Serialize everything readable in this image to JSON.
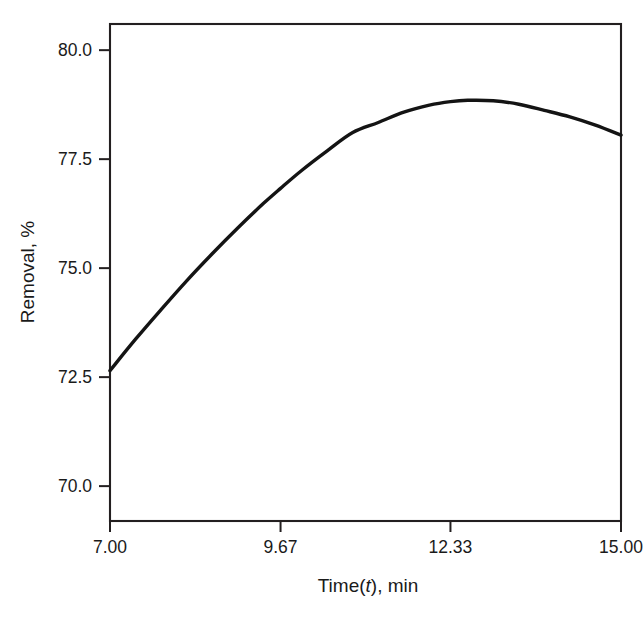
{
  "chart_data": {
    "type": "line",
    "title": "",
    "subtitle": "",
    "xlabel_parts": {
      "pre": "Time(",
      "var": "t",
      "post": "), min"
    },
    "xlabel": "Time(t), min",
    "ylabel": "Removal, %",
    "xlim": [
      7.0,
      15.0
    ],
    "ylim": [
      69.2,
      80.6
    ],
    "xticks": [
      7.0,
      9.67,
      12.33,
      15.0
    ],
    "xtick_labels": [
      "7.00",
      "9.67",
      "12.33",
      "15.00"
    ],
    "yticks": [
      70.0,
      72.5,
      75.0,
      77.5,
      80.0
    ],
    "ytick_labels": [
      "70.0",
      "72.5",
      "75.0",
      "77.5",
      "80.0"
    ],
    "grid": false,
    "legend": "none",
    "series": [
      {
        "name": "Removal",
        "color": "#141414",
        "x": [
          7.0,
          7.4,
          7.8,
          8.2,
          8.6,
          9.0,
          9.4,
          9.67,
          10.0,
          10.4,
          10.8,
          11.2,
          11.6,
          12.0,
          12.33,
          12.6,
          13.0,
          13.4,
          13.8,
          14.2,
          14.6,
          15.0
        ],
        "y": [
          72.65,
          73.37,
          74.05,
          74.71,
          75.33,
          75.92,
          76.48,
          76.83,
          77.24,
          77.69,
          78.11,
          78.34,
          78.58,
          78.74,
          78.82,
          78.85,
          78.84,
          78.76,
          78.62,
          78.47,
          78.28,
          78.05
        ]
      }
    ],
    "fit": {
      "form": "quadratic",
      "equation": "y = 72.65 + 1.86 (t - 7) - 0.158 (t - 7)^2",
      "peak_x": 12.89,
      "peak_y": 78.85
    }
  },
  "axes": {
    "frame_color": "#231f20",
    "background": "#ffffff"
  }
}
